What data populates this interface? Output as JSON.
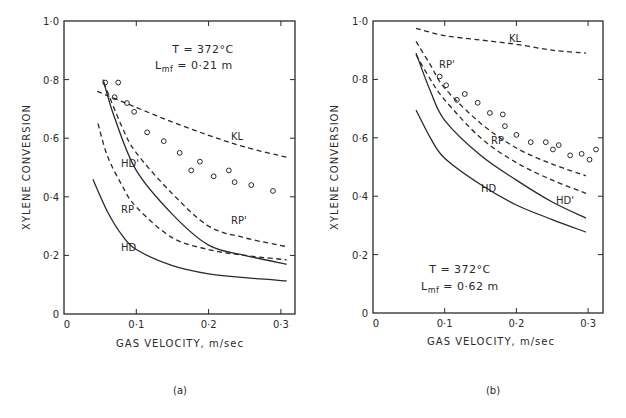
{
  "chart_data": [
    {
      "type": "line",
      "panel": "(a)",
      "xlabel": "GAS VELOCITY, m/sec",
      "ylabel": "XYLENE CONVERSION",
      "xlim": [
        0,
        0.32
      ],
      "ylim": [
        0,
        1.0
      ],
      "xticks": [
        "0",
        "0·1",
        "0·2",
        "0·3"
      ],
      "xtick_values": [
        0,
        0.1,
        0.2,
        0.3
      ],
      "yticks": [
        "0",
        "0·2",
        "0·4",
        "0·6",
        "0·8",
        "1·0"
      ],
      "ytick_values": [
        0,
        0.2,
        0.4,
        0.6,
        0.8,
        1.0
      ],
      "grid": false,
      "annotations": [
        "T = 372°C",
        "Lmf = 0·21 m"
      ],
      "series": [
        {
          "name": "KL",
          "style": "dashed",
          "x": [
            0.046,
            0.1,
            0.15,
            0.2,
            0.25,
            0.308
          ],
          "y": [
            0.76,
            0.705,
            0.655,
            0.61,
            0.57,
            0.535
          ]
        },
        {
          "name": "RP'",
          "style": "dashed",
          "x": [
            0.055,
            0.08,
            0.1,
            0.15,
            0.2,
            0.25,
            0.308
          ],
          "y": [
            0.79,
            0.64,
            0.55,
            0.41,
            0.3,
            0.26,
            0.23
          ]
        },
        {
          "name": "HD'",
          "style": "solid",
          "x": [
            0.054,
            0.07,
            0.1,
            0.15,
            0.2,
            0.25,
            0.308
          ],
          "y": [
            0.8,
            0.67,
            0.49,
            0.34,
            0.235,
            0.2,
            0.17
          ]
        },
        {
          "name": "RP",
          "style": "dashed",
          "x": [
            0.047,
            0.06,
            0.08,
            0.1,
            0.15,
            0.2,
            0.25,
            0.308
          ],
          "y": [
            0.65,
            0.54,
            0.44,
            0.365,
            0.26,
            0.22,
            0.2,
            0.185
          ]
        },
        {
          "name": "HD",
          "style": "solid",
          "x": [
            0.04,
            0.06,
            0.08,
            0.1,
            0.15,
            0.2,
            0.25,
            0.308
          ],
          "y": [
            0.46,
            0.35,
            0.27,
            0.22,
            0.165,
            0.137,
            0.124,
            0.113
          ]
        },
        {
          "name": "Experimental",
          "style": "markers",
          "marker": "open-circle",
          "x": [
            0.057,
            0.075,
            0.07,
            0.087,
            0.097,
            0.115,
            0.138,
            0.16,
            0.176,
            0.188,
            0.207,
            0.228,
            0.236,
            0.259,
            0.289
          ],
          "y": [
            0.79,
            0.79,
            0.74,
            0.72,
            0.69,
            0.62,
            0.59,
            0.55,
            0.49,
            0.52,
            0.47,
            0.49,
            0.45,
            0.44,
            0.42
          ]
        }
      ]
    },
    {
      "type": "line",
      "panel": "(b)",
      "xlabel": "GAS VELOCITY, m/sec",
      "ylabel": "XYLENE CONVERSION",
      "xlim": [
        0,
        0.32
      ],
      "ylim": [
        0,
        1.0
      ],
      "xticks": [
        "0",
        "0·1",
        "0·2",
        "0·3"
      ],
      "xtick_values": [
        0,
        0.1,
        0.2,
        0.3
      ],
      "yticks": [
        "0",
        "0·2",
        "0·4",
        "0·6",
        "0·8",
        "1·0"
      ],
      "ytick_values": [
        0,
        0.2,
        0.4,
        0.6,
        0.8,
        1.0
      ],
      "grid": false,
      "annotations": [
        "T = 372°C",
        "Lmf = 0·62 m"
      ],
      "series": [
        {
          "name": "KL",
          "style": "dashed",
          "x": [
            0.06,
            0.1,
            0.15,
            0.2,
            0.25,
            0.297
          ],
          "y": [
            0.975,
            0.95,
            0.935,
            0.92,
            0.9,
            0.89
          ]
        },
        {
          "name": "RP'",
          "style": "dashed",
          "x": [
            0.06,
            0.08,
            0.1,
            0.15,
            0.2,
            0.25,
            0.297
          ],
          "y": [
            0.93,
            0.85,
            0.77,
            0.65,
            0.565,
            0.51,
            0.47
          ]
        },
        {
          "name": "RP",
          "style": "dashed",
          "x": [
            0.06,
            0.08,
            0.1,
            0.15,
            0.2,
            0.25,
            0.297
          ],
          "y": [
            0.885,
            0.8,
            0.73,
            0.6,
            0.515,
            0.455,
            0.41
          ]
        },
        {
          "name": "HD'",
          "style": "solid",
          "x": [
            0.06,
            0.08,
            0.1,
            0.15,
            0.2,
            0.25,
            0.297
          ],
          "y": [
            0.89,
            0.76,
            0.66,
            0.54,
            0.455,
            0.38,
            0.325
          ]
        },
        {
          "name": "HD",
          "style": "solid",
          "x": [
            0.06,
            0.08,
            0.1,
            0.15,
            0.2,
            0.25,
            0.297
          ],
          "y": [
            0.695,
            0.6,
            0.53,
            0.44,
            0.37,
            0.32,
            0.277
          ]
        },
        {
          "name": "Experimental",
          "style": "markers",
          "marker": "open-circle",
          "x": [
            0.093,
            0.102,
            0.117,
            0.128,
            0.146,
            0.163,
            0.181,
            0.184,
            0.2,
            0.22,
            0.241,
            0.251,
            0.259,
            0.275,
            0.291,
            0.302,
            0.311
          ],
          "y": [
            0.81,
            0.78,
            0.73,
            0.75,
            0.72,
            0.685,
            0.68,
            0.64,
            0.61,
            0.585,
            0.585,
            0.56,
            0.575,
            0.54,
            0.545,
            0.525,
            0.56
          ]
        }
      ]
    }
  ],
  "panels": {
    "a": {
      "label": "(a)",
      "annot_T": "T = 372°C",
      "annot_L_prefix": "L",
      "annot_L_sub": "mf",
      "annot_L_value": " = 0·21 m",
      "ylabel": "XYLENE CONVERSION",
      "xlabel": "GAS VELOCITY, m/sec",
      "curve_labels": {
        "KL": "KL",
        "RPp": "RP'",
        "HDp": "HD'",
        "RP": "RP",
        "HD": "HD"
      }
    },
    "b": {
      "label": "(b)",
      "annot_T": "T = 372°C",
      "annot_L_prefix": "L",
      "annot_L_sub": "mf",
      "annot_L_value": " = 0·62 m",
      "ylabel": "XYLENE CONVERSION",
      "xlabel": "GAS VELOCITY, m/sec",
      "curve_labels": {
        "KL": "KL",
        "RPp": "RP'",
        "HDp": "HD'",
        "RP": "RP",
        "HD": "HD"
      }
    }
  },
  "colors": {
    "ink": "#2a2a2a",
    "background": "#ffffff"
  }
}
